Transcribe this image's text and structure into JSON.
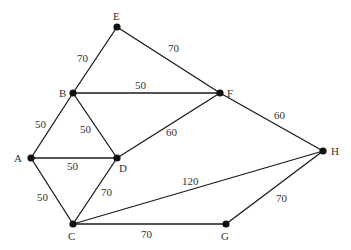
{
  "graph": {
    "nodes": [
      {
        "id": "E",
        "label": "E",
        "x": 117,
        "y": 27,
        "lx": 113,
        "ly": 20
      },
      {
        "id": "B",
        "label": "B",
        "x": 73,
        "y": 93,
        "lx": 59,
        "ly": 97
      },
      {
        "id": "F",
        "label": "F",
        "x": 220,
        "y": 93,
        "lx": 227,
        "ly": 97
      },
      {
        "id": "A",
        "label": "A",
        "x": 31,
        "y": 158,
        "lx": 14,
        "ly": 162
      },
      {
        "id": "D",
        "label": "D",
        "x": 117,
        "y": 158,
        "lx": 119,
        "ly": 172
      },
      {
        "id": "H",
        "label": "H",
        "x": 323,
        "y": 151,
        "lx": 331,
        "ly": 155
      },
      {
        "id": "C",
        "label": "C",
        "x": 73,
        "y": 224,
        "lx": 68,
        "ly": 240
      },
      {
        "id": "G",
        "label": "G",
        "x": 226,
        "y": 224,
        "lx": 221,
        "ly": 240
      }
    ],
    "edges": [
      {
        "from": "E",
        "to": "B",
        "weight": "70",
        "lx": 77,
        "ly": 62
      },
      {
        "from": "E",
        "to": "F",
        "weight": "70",
        "lx": 168,
        "ly": 52
      },
      {
        "from": "B",
        "to": "F",
        "weight": "50",
        "lx": 135,
        "ly": 89
      },
      {
        "from": "B",
        "to": "A",
        "weight": "50",
        "lx": 35,
        "ly": 128
      },
      {
        "from": "B",
        "to": "D",
        "weight": "50",
        "lx": 80,
        "ly": 133
      },
      {
        "from": "A",
        "to": "D",
        "weight": "50",
        "lx": 67,
        "ly": 170
      },
      {
        "from": "D",
        "to": "F",
        "weight": "60",
        "lx": 166,
        "ly": 136
      },
      {
        "from": "A",
        "to": "C",
        "weight": "50",
        "lx": 37,
        "ly": 201
      },
      {
        "from": "D",
        "to": "C",
        "weight": "70",
        "lx": 101,
        "ly": 196
      },
      {
        "from": "F",
        "to": "H",
        "weight": "60",
        "lx": 274,
        "ly": 119
      },
      {
        "from": "C",
        "to": "H",
        "weight": "120",
        "lx": 182,
        "ly": 185
      },
      {
        "from": "C",
        "to": "G",
        "weight": "70",
        "lx": 141,
        "ly": 238
      },
      {
        "from": "G",
        "to": "H",
        "weight": "70",
        "lx": 276,
        "ly": 202
      }
    ]
  },
  "colors": {
    "edge": "#1a1a1a",
    "node": "#111111",
    "text": "#333333",
    "background": "#ffffff"
  }
}
